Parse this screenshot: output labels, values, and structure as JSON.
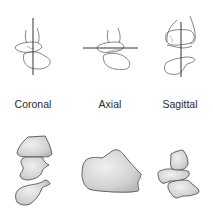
{
  "figure": {
    "planes": [
      {
        "label": "Coronal",
        "line_orientation": "vertical"
      },
      {
        "label": "Axial",
        "line_orientation": "horizontal"
      },
      {
        "label": "Sagittal",
        "line_orientation": "vertical"
      }
    ]
  },
  "colors": {
    "outline": "#555555",
    "cut_line": "#333333",
    "bone_fill_light": "#e6e6e6",
    "bone_fill_dark": "#bdbdbd",
    "label_text": "#2a2a2a"
  }
}
